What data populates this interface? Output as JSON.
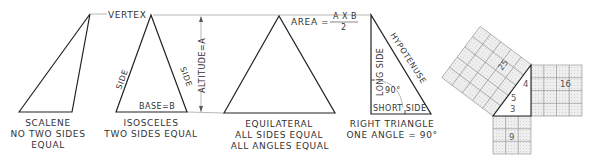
{
  "labels": {
    "vertex": "VERTEX",
    "area_prefix": "AREA =",
    "area_numerator": "A X B",
    "area_denominator": "2",
    "altitude": "ALTITUDE=A",
    "side_left": "SIDE",
    "side_right": "SIDE",
    "base": "BASE=B",
    "long_side": "LONG SIDE",
    "hypotenuse": "HYPOTENUSE",
    "angle": "90°",
    "short_side": "SHORT SIDE"
  },
  "triangles": [
    {
      "name": "scalene",
      "title": "SCALENE",
      "line2": "NO TWO SIDES",
      "line3": "EQUAL"
    },
    {
      "name": "isosceles",
      "title": "ISOSCELES",
      "line2": "TWO SIDES EQUAL",
      "line3": ""
    },
    {
      "name": "equilateral",
      "title": "EQUILATERAL",
      "line2": "ALL SIDES EQUAL",
      "line3": "ALL ANGLES EQUAL"
    },
    {
      "name": "right",
      "title": "RIGHT TRIANGLE",
      "line2": "ONE ANGLE = 90°",
      "line3": ""
    }
  ],
  "pythagoras": {
    "side_a": "3",
    "side_b": "4",
    "side_c": "5",
    "square_a": "9",
    "square_b": "16",
    "square_c": "25",
    "square_fill": "#e6e6e6"
  }
}
